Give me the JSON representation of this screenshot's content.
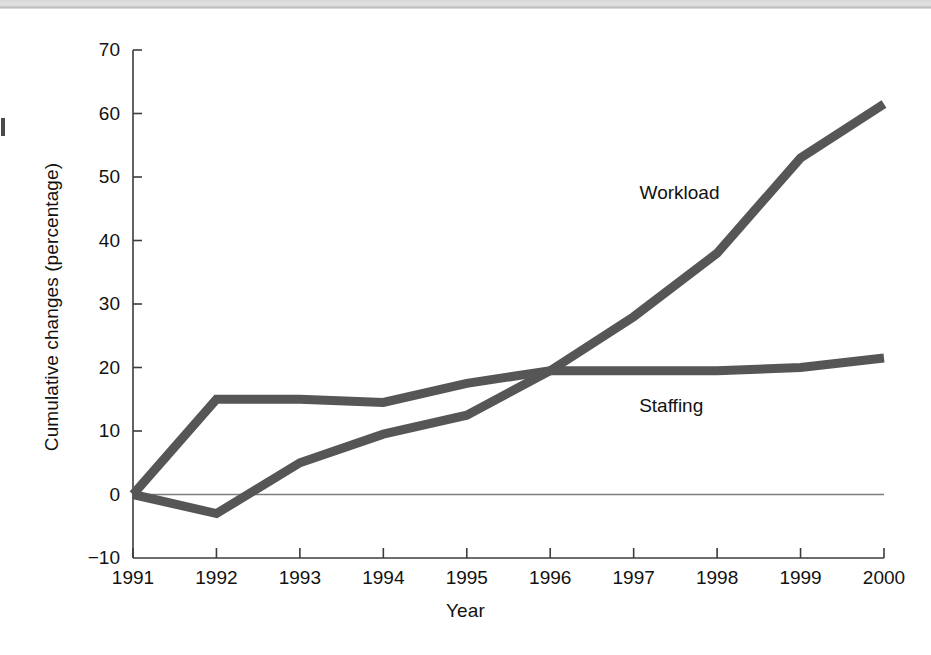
{
  "chart_data": {
    "type": "line",
    "title": "",
    "xlabel": "Year",
    "ylabel": "Cumulative changes (percentage)",
    "x": [
      1991,
      1992,
      1993,
      1994,
      1995,
      1996,
      1997,
      1998,
      1999,
      2000
    ],
    "categories": [
      "1991",
      "1992",
      "1993",
      "1994",
      "1995",
      "1996",
      "1997",
      "1998",
      "1999",
      "2000"
    ],
    "series": [
      {
        "name": "Workload",
        "values": [
          0,
          -3,
          5,
          9.5,
          12.5,
          19.5,
          28,
          38,
          53,
          61.5
        ],
        "color": "#565656",
        "label_x": 1997.55,
        "label_y": 47.5
      },
      {
        "name": "Staffing",
        "values": [
          0,
          15,
          15,
          14.5,
          17.5,
          19.5,
          19.5,
          19.5,
          20,
          21.5
        ],
        "color": "#565656",
        "label_x": 1997.45,
        "label_y": 14.0
      }
    ],
    "xlim": [
      1991,
      2000
    ],
    "ylim": [
      -10,
      70
    ],
    "yticks": [
      -10,
      0,
      10,
      20,
      30,
      40,
      50,
      60,
      70
    ],
    "ytick_labels": [
      "−10",
      "0",
      "10",
      "20",
      "30",
      "40",
      "50",
      "60",
      "70"
    ],
    "xticks": [
      1991,
      1992,
      1993,
      1994,
      1995,
      1996,
      1997,
      1998,
      1999,
      2000
    ],
    "xtick_labels": [
      "1991",
      "1992",
      "1993",
      "1994",
      "1995",
      "1996",
      "1997",
      "1998",
      "1999",
      "2000"
    ],
    "grid": false,
    "legend": "inline-labels",
    "zero_line": true,
    "zero_line_color": "#7d7d7d",
    "axis_color": "#3c3c3c",
    "line_width_px": 9,
    "background": "#ffffff"
  }
}
